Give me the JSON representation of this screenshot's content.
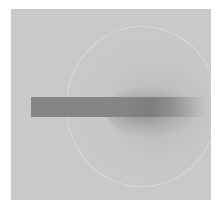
{
  "image": {
    "description": "Grayscale diffraction-style image with a circular ring and a horizontal dark beamstop bar",
    "colors": {
      "background": "#ffffff",
      "frame": "#c9c9c9",
      "ring": "#dadada",
      "beamstop": "#858585"
    },
    "elements": [
      "frame",
      "ring",
      "central-halo",
      "beamstop-bar"
    ]
  }
}
